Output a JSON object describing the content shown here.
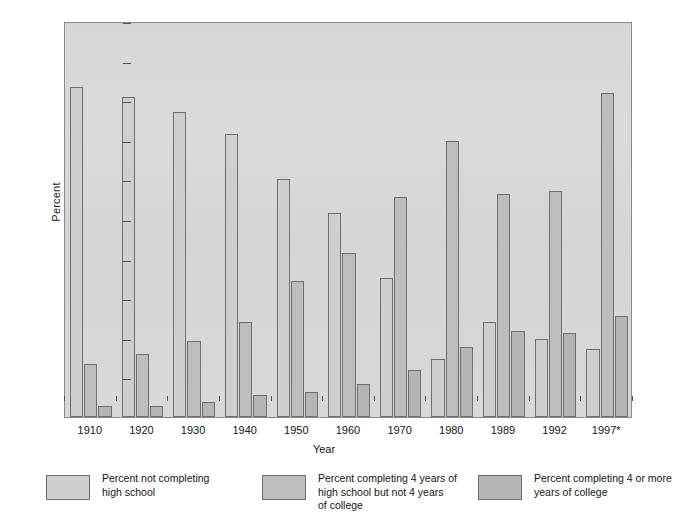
{
  "chart_data": {
    "type": "bar",
    "title": "",
    "xlabel": "Year",
    "ylabel": "Percent",
    "ylim": [
      0,
      100
    ],
    "yticks": [
      10,
      20,
      30,
      40,
      50,
      60,
      70,
      80,
      90,
      100
    ],
    "grid": false,
    "legend_position": "bottom",
    "categories": [
      "1910",
      "1920",
      "1930",
      "1940",
      "1950",
      "1960",
      "1970",
      "1980",
      "1989",
      "1992",
      "1997*"
    ],
    "series": [
      {
        "name": "Percent not completing high school",
        "color": "#cfcfcf",
        "values": [
          83.3,
          80.8,
          76.9,
          71.4,
          60.2,
          51.5,
          35.0,
          14.7,
          24.0,
          19.8,
          17.3
        ]
      },
      {
        "name": "Percent completing 4 years of high school but not 4 years of college",
        "color": "#bdbdbd",
        "values": [
          13.5,
          16.0,
          19.1,
          24.1,
          34.4,
          41.3,
          55.5,
          69.6,
          56.2,
          57.0,
          81.8
        ]
      },
      {
        "name": "Percent completing 4 or more years of college",
        "color": "#b5b5b5",
        "values": [
          2.7,
          2.7,
          3.9,
          5.6,
          6.2,
          8.4,
          11.8,
          17.6,
          21.8,
          21.2,
          25.6
        ]
      }
    ]
  },
  "legend": {
    "items": [
      {
        "label": "Percent not completing\nhigh school",
        "color": "#cfcfcf"
      },
      {
        "label": "Percent completing 4 years of\nhigh school but not 4 years\nof college",
        "color": "#bdbdbd"
      },
      {
        "label": "Percent completing 4 or more\nyears of college",
        "color": "#b5b5b5"
      }
    ]
  }
}
